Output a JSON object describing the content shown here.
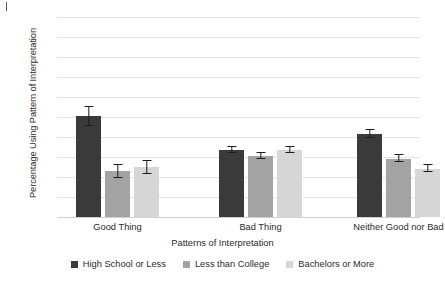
{
  "chart_data": {
    "type": "bar",
    "title": "",
    "xlabel": "Patterns of Interpretation",
    "ylabel": "Percentage Using Pattern of Interpretation",
    "ylim": [
      0,
      100
    ],
    "ytick_step": 10,
    "yticks": [
      "100",
      "90",
      "80",
      "70",
      "60",
      "50",
      "40",
      "30",
      "20",
      "10",
      "0"
    ],
    "grid": true,
    "legend_position": "bottom",
    "categories": [
      "Good Thing",
      "Bad Thing",
      "Neither Good nor Bad"
    ],
    "series": [
      {
        "name": "High School or Less",
        "color": "#3a3a3a",
        "values": [
          50.3,
          33.5,
          41.5
        ],
        "error_low": [
          45.5,
          31.8,
          39.5
        ],
        "error_high": [
          55.0,
          35.0,
          43.5
        ]
      },
      {
        "name": "Less than College",
        "color": "#a3a3a3",
        "values": [
          22.8,
          30.5,
          29.2
        ],
        "error_low": [
          19.5,
          29.0,
          27.5
        ],
        "error_high": [
          26.0,
          32.0,
          30.8
        ]
      },
      {
        "name": "Bachelors or More",
        "color": "#d6d6d6",
        "values": [
          24.8,
          33.3,
          24.2
        ],
        "error_low": [
          21.5,
          31.8,
          22.5
        ],
        "error_high": [
          28.0,
          35.0,
          26.0
        ]
      }
    ]
  },
  "colors": {
    "grid": "#e4e4e4",
    "axis": "#d0d0d0",
    "text": "#2b2b2b",
    "error": "#1c1c1c",
    "background": "#ffffff"
  }
}
